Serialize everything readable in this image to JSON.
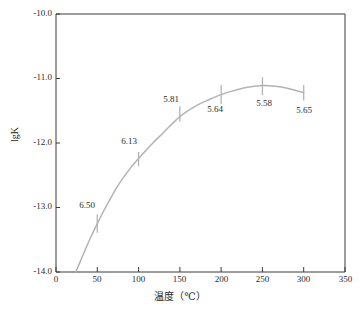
{
  "chart_data": {
    "type": "line",
    "title": "",
    "subtitle": "",
    "xlabel": "温度（℃）",
    "ylabel": "lgK",
    "xlim": [
      0,
      350
    ],
    "ylim": [
      -14.0,
      -10.0
    ],
    "grid": false,
    "legend": false,
    "x_ticks": [
      "0",
      "50",
      "100",
      "150",
      "200",
      "250",
      "300",
      "350"
    ],
    "x_tick_values": [
      0,
      50,
      100,
      150,
      200,
      250,
      300,
      350
    ],
    "y_ticks": [
      "-14.0",
      "-13.0",
      "-12.0",
      "-11.0",
      "-10.0"
    ],
    "y_tick_values": [
      -14.0,
      -13.0,
      -12.0,
      -11.0,
      -10.0
    ],
    "series": [
      {
        "name": "lgK",
        "color": "#b3b3b3",
        "x": [
          50,
          100,
          150,
          200,
          250,
          300
        ],
        "values": [
          -13.25,
          -12.25,
          -11.55,
          -11.25,
          -11.12,
          -11.22
        ],
        "errors": [
          0.14,
          0.11,
          0.12,
          0.15,
          0.14,
          0.12
        ],
        "point_labels": [
          "6.50",
          "6.13",
          "5.81",
          "5.64",
          "5.58",
          "5.65"
        ]
      }
    ],
    "curve_path_points": [
      [
        24,
        -14.0
      ],
      [
        40,
        -13.52
      ],
      [
        50,
        -13.25
      ],
      [
        60,
        -13.0
      ],
      [
        75,
        -12.66
      ],
      [
        90,
        -12.39
      ],
      [
        100,
        -12.24
      ],
      [
        115,
        -12.03
      ],
      [
        130,
        -11.84
      ],
      [
        150,
        -11.59
      ],
      [
        170,
        -11.42
      ],
      [
        185,
        -11.33
      ],
      [
        200,
        -11.25
      ],
      [
        215,
        -11.19
      ],
      [
        230,
        -11.14
      ],
      [
        250,
        -11.11
      ],
      [
        265,
        -11.12
      ],
      [
        280,
        -11.15
      ],
      [
        300,
        -11.22
      ]
    ],
    "annotations": [
      {
        "text": "6.50",
        "x": 50,
        "position": "above-left"
      },
      {
        "text": "6.13",
        "x": 100,
        "position": "above-left"
      },
      {
        "text": "5.81",
        "x": 150,
        "position": "above-left"
      },
      {
        "text": "5.64",
        "x": 200,
        "position": "below"
      },
      {
        "text": "5.58",
        "x": 250,
        "position": "below"
      },
      {
        "text": "5.65",
        "x": 300,
        "position": "below"
      }
    ],
    "colors": {
      "axis": "#3a3a3a",
      "curve": "#b3b3b3",
      "errorbar": "#b3b3b3",
      "text": "#222222",
      "background": "#ffffff"
    }
  },
  "axes": {
    "x_tick_0": "0",
    "x_tick_1": "50",
    "x_tick_2": "100",
    "x_tick_3": "150",
    "x_tick_4": "200",
    "x_tick_5": "250",
    "x_tick_6": "300",
    "x_tick_7": "350",
    "y_tick_0": "-10.0",
    "y_tick_1": "-11.0",
    "y_tick_2": "-12.0",
    "y_tick_3": "-13.0",
    "y_tick_4": "-14.0",
    "x_title": "温度（℃）",
    "y_title": "lgK"
  },
  "labels": {
    "p0": "6.50",
    "p1": "6.13",
    "p2": "5.81",
    "p3": "5.64",
    "p4": "5.58",
    "p5": "5.65"
  }
}
